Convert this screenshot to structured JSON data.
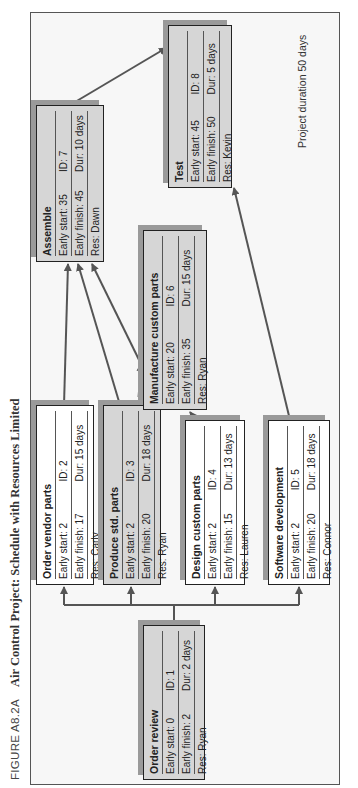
{
  "caption": {
    "figure_label": "FIGURE A8.2A",
    "title": "Air Control Project: Schedule with Resources Limited"
  },
  "note": "Project duration 50 days",
  "nodes": [
    {
      "id_key": "order_review",
      "name": "Order review",
      "early_start": "Early start:  0",
      "id": "ID:  1",
      "early_finish": "Early finish: 2",
      "dur": "Dur: 2 days",
      "res": "Res: Ryan",
      "shaded": true
    },
    {
      "id_key": "order_vendor_parts",
      "name": "Order vendor parts",
      "early_start": "Early start:  2",
      "id": "ID:  2",
      "early_finish": "Early finish: 17",
      "dur": "Dur: 15 days",
      "res": "Res: Carly",
      "shaded": false
    },
    {
      "id_key": "produce_std_parts",
      "name": "Produce std. parts",
      "early_start": "Early start:  2",
      "id": "ID:  3",
      "early_finish": "Early finish: 20",
      "dur": "Dur: 18 days",
      "res": "Res: Ryan",
      "shaded": true
    },
    {
      "id_key": "design_custom_parts",
      "name": "Design custom parts",
      "early_start": "Early start:  2",
      "id": "ID:  4",
      "early_finish": "Early finish: 15",
      "dur": "Dur: 13 days",
      "res": "Res: Lauren",
      "shaded": false
    },
    {
      "id_key": "software_development",
      "name": "Software development",
      "early_start": "Early start:  2",
      "id": "ID:  5",
      "early_finish": "Early finish: 20",
      "dur": "Dur: 18 days",
      "res": "Res: Connor",
      "shaded": false
    },
    {
      "id_key": "manufacture_custom_parts",
      "name": "Manufacture custom parts",
      "early_start": "Early start:  20",
      "id": "ID:  6",
      "early_finish": "Early finish: 35",
      "dur": "Dur: 15 days",
      "res": "Res: Ryan",
      "shaded": true
    },
    {
      "id_key": "assemble",
      "name": "Assemble",
      "early_start": "Early start:  35",
      "id": "ID:  7",
      "early_finish": "Early finish: 45",
      "dur": "Dur: 10 days",
      "res": "Res: Dawn",
      "shaded": true
    },
    {
      "id_key": "test",
      "name": "Test",
      "early_start": "Early start:  45",
      "id": "ID:  8",
      "early_finish": "Early finish: 50",
      "dur": "Dur: 5 days",
      "res": "Res: Kevin",
      "shaded": true
    }
  ],
  "edges": [
    {
      "from": "Order review",
      "to": "Order vendor parts",
      "style": "solid"
    },
    {
      "from": "Order review",
      "to": "Produce std. parts",
      "style": "solid"
    },
    {
      "from": "Order review",
      "to": "Design custom parts",
      "style": "solid"
    },
    {
      "from": "Order review",
      "to": "Software development",
      "style": "solid"
    },
    {
      "from": "Order vendor parts",
      "to": "Assemble",
      "style": "solid"
    },
    {
      "from": "Produce std. parts",
      "to": "Assemble",
      "style": "solid"
    },
    {
      "from": "Produce std. parts",
      "to": "Manufacture custom parts",
      "style": "dashed"
    },
    {
      "from": "Design custom parts",
      "to": "Manufacture custom parts",
      "style": "solid"
    },
    {
      "from": "Manufacture custom parts",
      "to": "Assemble",
      "style": "solid"
    },
    {
      "from": "Assemble",
      "to": "Test",
      "style": "solid"
    },
    {
      "from": "Software development",
      "to": "Test",
      "style": "solid"
    }
  ],
  "colors": {
    "frame": "#555555",
    "box_shaded": "#d6d6d6",
    "box_white": "#ffffff",
    "shadow": "#9a9a9a",
    "arrow": "#555555"
  }
}
